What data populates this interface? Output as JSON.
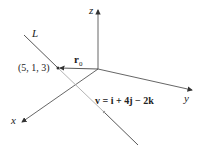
{
  "diagram": {
    "type": "3d-vector-line-diagram",
    "axes": {
      "x_label": "x",
      "y_label": "y",
      "z_label": "z"
    },
    "line_label": "L",
    "point_label": "(5, 1, 3)",
    "position_vector_label": "r",
    "position_vector_subscript": "0",
    "direction_vector_label": "v = i + 4j − 2k",
    "colors": {
      "axis": "#333333",
      "line_front": "#333333",
      "line_behind": "#aaaaaa"
    }
  }
}
